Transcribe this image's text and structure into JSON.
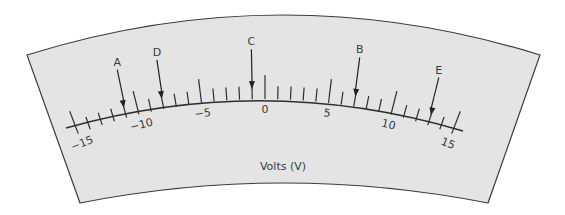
{
  "meter": {
    "unit_label": "Volts (V)",
    "scale": {
      "min": -15,
      "max": 15,
      "major_step": 5,
      "minor_step": 1,
      "major_labels": [
        "−15",
        "−10",
        "−5",
        "0",
        "5",
        "10",
        "15"
      ]
    },
    "pointers": [
      {
        "label": "A",
        "value": -11
      },
      {
        "label": "D",
        "value": -8
      },
      {
        "label": "C",
        "value": -1
      },
      {
        "label": "B",
        "value": 7
      },
      {
        "label": "E",
        "value": 13
      }
    ],
    "colors": {
      "panel_fill": "#e4e4e4",
      "outline": "#3c3c3c",
      "ink": "#2e2e2e"
    }
  }
}
